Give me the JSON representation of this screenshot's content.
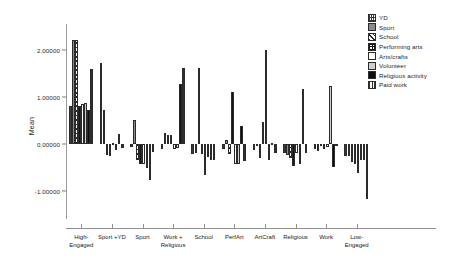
{
  "chart_data": {
    "type": "bar",
    "title": "",
    "xlabel": "",
    "ylabel": "Mean",
    "ylim": [
      -1.6,
      2.55
    ],
    "grid": false,
    "legend_position": "top-right",
    "y_ticks": [
      "2.00000",
      "1.00000",
      "0.00000",
      "-1.00000"
    ],
    "y_tick_values": [
      2,
      1,
      0,
      -1
    ],
    "categories": [
      "High-\nEngaged",
      "Sport +YD",
      "Sport",
      "Work +\nReligious",
      "School",
      "PerfArt",
      "ArtCraft",
      "Religious",
      "Work",
      "Low-\nEngaged"
    ],
    "series": [
      {
        "name": "YD",
        "pattern": "p-yd",
        "values": [
          0.8,
          1.72,
          -0.06,
          -0.1,
          -0.22,
          -0.12,
          -0.14,
          -0.2,
          -0.1,
          -0.26
        ]
      },
      {
        "name": "Sport",
        "pattern": "p-sport",
        "values": [
          2.22,
          0.72,
          0.5,
          0.22,
          -0.2,
          0.08,
          -0.02,
          -0.24,
          -0.16,
          -0.26
        ]
      },
      {
        "name": "School",
        "pattern": "p-school",
        "values": [
          2.22,
          -0.24,
          -0.34,
          0.18,
          1.62,
          -0.22,
          -0.3,
          -0.3,
          -0.04,
          -0.38
        ]
      },
      {
        "name": "Performing arts",
        "pattern": "p-perf",
        "values": [
          0.8,
          -0.26,
          -0.44,
          0.18,
          -0.22,
          1.1,
          0.46,
          -0.48,
          -0.12,
          -0.44
        ]
      },
      {
        "name": "Arts/crafts",
        "pattern": "p-arts",
        "values": [
          0.84,
          0.02,
          -0.44,
          -0.12,
          -0.66,
          -0.44,
          2.0,
          -0.2,
          -0.06,
          -0.62
        ]
      },
      {
        "name": "Volunteer",
        "pattern": "p-vol",
        "values": [
          0.86,
          -0.14,
          -0.52,
          -0.08,
          -0.28,
          -0.44,
          -0.34,
          -0.44,
          1.24,
          -0.34
        ]
      },
      {
        "name": "Religious activity",
        "pattern": "p-rel",
        "values": [
          0.72,
          0.2,
          -0.78,
          1.28,
          -0.34,
          0.38,
          0.02,
          1.16,
          -0.5,
          -0.34
        ]
      },
      {
        "name": "Paid work",
        "pattern": "p-paid",
        "values": [
          1.6,
          -0.08,
          -0.18,
          1.62,
          -0.34,
          -0.36,
          -0.2,
          -0.2,
          -0.02,
          -1.18
        ]
      }
    ]
  }
}
